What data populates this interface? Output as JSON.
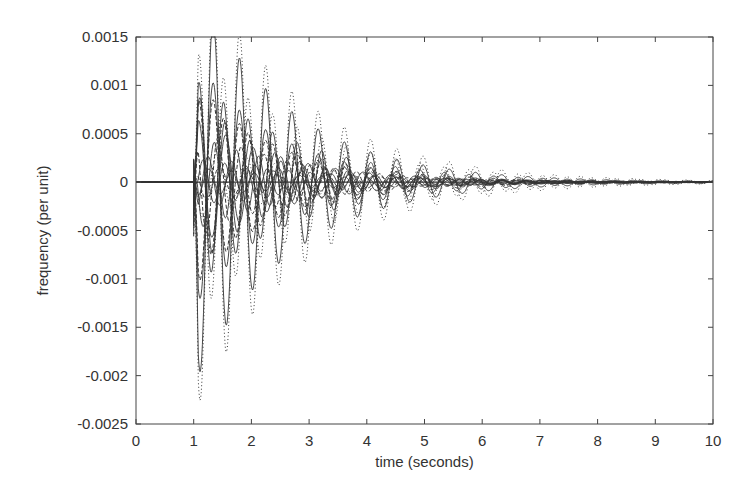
{
  "chart_data": {
    "type": "line",
    "title": "",
    "xlabel": "time (seconds)",
    "ylabel": "frequency (per unit)",
    "xlim": [
      0,
      10
    ],
    "ylim": [
      -0.0025,
      0.0015
    ],
    "grid": false,
    "legend": null,
    "x_ticks": [
      0,
      1,
      2,
      3,
      4,
      5,
      6,
      7,
      8,
      9,
      10
    ],
    "x_tick_labels": [
      "0",
      "1",
      "2",
      "3",
      "4",
      "5",
      "6",
      "7",
      "8",
      "9",
      "10"
    ],
    "y_ticks": [
      0.0015,
      0.001,
      0.0005,
      0,
      -0.0005,
      -0.001,
      -0.0015,
      -0.002,
      -0.0025
    ],
    "y_tick_labels": [
      "0.0015",
      "0.001",
      "0.0005",
      "0",
      "-0.0005",
      "-0.001",
      "-0.0015",
      "-0.002",
      "-0.0025"
    ],
    "disturbance_time": 1.0,
    "key_extremes": {
      "max_peak": {
        "t": 1.35,
        "value": 0.00135
      },
      "min_peak": {
        "t": 1.1,
        "value": -0.0024
      },
      "first_positive_peak": {
        "t": 1.1,
        "value": 0.00095
      },
      "second_negative_peak": {
        "t": 1.6,
        "value": -0.00135
      }
    },
    "series": [
      {
        "name": "trace-1",
        "style": "dotted",
        "amp": 0.0024,
        "freq": 2.2,
        "phase": 3.14,
        "decay": 0.55
      },
      {
        "name": "trace-2",
        "style": "solid",
        "amp": 0.0021,
        "freq": 2.2,
        "phase": 3.14,
        "decay": 0.62
      },
      {
        "name": "trace-3",
        "style": "solid",
        "amp": 0.0013,
        "freq": 2.2,
        "phase": 3.14,
        "decay": 0.7
      },
      {
        "name": "trace-4",
        "style": "dashed",
        "amp": 0.0011,
        "freq": 2.2,
        "phase": 3.14,
        "decay": 0.75
      },
      {
        "name": "trace-5",
        "style": "dotted",
        "amp": 0.0014,
        "freq": 2.35,
        "phase": 0.2,
        "decay": 0.5
      },
      {
        "name": "trace-6",
        "style": "solid",
        "amp": 0.0011,
        "freq": 2.35,
        "phase": 0.2,
        "decay": 0.55
      },
      {
        "name": "trace-7",
        "style": "dashed",
        "amp": 0.0009,
        "freq": 2.35,
        "phase": 0.2,
        "decay": 0.6
      },
      {
        "name": "trace-8",
        "style": "solid",
        "amp": 0.00095,
        "freq": 2.3,
        "phase": 0.0,
        "decay": 0.8
      },
      {
        "name": "trace-9",
        "style": "solid",
        "amp": 0.0007,
        "freq": 2.1,
        "phase": 0.5,
        "decay": 0.65
      },
      {
        "name": "trace-10",
        "style": "dashed",
        "amp": 0.0006,
        "freq": 2.5,
        "phase": 1.2,
        "decay": 0.6
      },
      {
        "name": "trace-11",
        "style": "solid",
        "amp": 0.0005,
        "freq": 2.6,
        "phase": 2.0,
        "decay": 0.55
      },
      {
        "name": "trace-12",
        "style": "dotted",
        "amp": 0.0004,
        "freq": 2.0,
        "phase": 2.6,
        "decay": 0.5
      },
      {
        "name": "trace-13",
        "style": "solid",
        "amp": 0.0003,
        "freq": 2.45,
        "phase": 4.0,
        "decay": 0.5
      },
      {
        "name": "trace-14",
        "style": "solid",
        "amp": 0.00025,
        "freq": 2.7,
        "phase": 5.0,
        "decay": 0.45
      },
      {
        "name": "trace-15",
        "style": "dashed",
        "amp": 0.0002,
        "freq": 2.15,
        "phase": 1.7,
        "decay": 0.4
      },
      {
        "name": "trace-16",
        "style": "solid",
        "amp": 0.00015,
        "freq": 2.55,
        "phase": 3.6,
        "decay": 0.4
      }
    ]
  },
  "layout": {
    "plot_left": 136,
    "plot_right": 713,
    "plot_top": 37,
    "plot_bottom": 424,
    "line_color": "#333333"
  }
}
